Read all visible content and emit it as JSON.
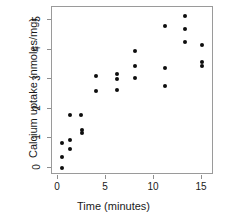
{
  "chart_data": {
    "type": "scatter",
    "title": "",
    "xlabel": "Time (minutes)",
    "ylabel": "Calcium uptake (nmoles/mg)",
    "xlim": [
      -0.6,
      16.2
    ],
    "ylim": [
      -0.25,
      5.45
    ],
    "xticks": [
      0,
      5,
      10,
      15
    ],
    "xtick_labels": [
      "0",
      "5",
      "10",
      "15"
    ],
    "yticks": [
      0,
      1,
      2,
      3,
      4,
      5
    ],
    "ytick_labels": [
      "0",
      "1",
      "2",
      "3",
      "4",
      "5"
    ],
    "grid": false,
    "legend": false,
    "marker": "filled-circle",
    "marker_color": "#0d0d0d",
    "frame_color": "#9a9a9a",
    "background": "#ffffff",
    "x": [
      0.45,
      0.45,
      0.45,
      1.3,
      1.3,
      1.3,
      2.4,
      2.55,
      2.55,
      3.95,
      3.95,
      6.1,
      6.1,
      6.1,
      8.05,
      8.05,
      8.05,
      11.15,
      11.15,
      11.15,
      13.15,
      13.15,
      13.15,
      15.0,
      15.0,
      15.0
    ],
    "y": [
      0.0,
      0.35,
      0.82,
      0.62,
      0.95,
      1.8,
      1.78,
      1.18,
      1.28,
      2.6,
      3.12,
      2.65,
      3.02,
      3.18,
      3.05,
      3.45,
      3.95,
      2.78,
      3.38,
      4.82,
      4.25,
      4.72,
      5.15,
      3.45,
      3.6,
      4.15
    ],
    "points": [
      {
        "x": 0.45,
        "y": 0.0
      },
      {
        "x": 0.45,
        "y": 0.35
      },
      {
        "x": 0.45,
        "y": 0.82
      },
      {
        "x": 1.3,
        "y": 0.62
      },
      {
        "x": 1.3,
        "y": 0.95
      },
      {
        "x": 1.3,
        "y": 1.8
      },
      {
        "x": 2.4,
        "y": 1.78
      },
      {
        "x": 2.55,
        "y": 1.18
      },
      {
        "x": 2.55,
        "y": 1.28
      },
      {
        "x": 3.95,
        "y": 2.6
      },
      {
        "x": 3.95,
        "y": 3.12
      },
      {
        "x": 6.1,
        "y": 2.65
      },
      {
        "x": 6.1,
        "y": 3.02
      },
      {
        "x": 6.1,
        "y": 3.18
      },
      {
        "x": 8.05,
        "y": 3.05
      },
      {
        "x": 8.05,
        "y": 3.45
      },
      {
        "x": 8.05,
        "y": 3.95
      },
      {
        "x": 11.15,
        "y": 2.78
      },
      {
        "x": 11.15,
        "y": 3.38
      },
      {
        "x": 11.15,
        "y": 4.82
      },
      {
        "x": 13.15,
        "y": 4.25
      },
      {
        "x": 13.15,
        "y": 4.72
      },
      {
        "x": 13.15,
        "y": 5.15
      },
      {
        "x": 15.0,
        "y": 3.45
      },
      {
        "x": 15.0,
        "y": 3.6
      },
      {
        "x": 15.0,
        "y": 4.15
      }
    ]
  }
}
